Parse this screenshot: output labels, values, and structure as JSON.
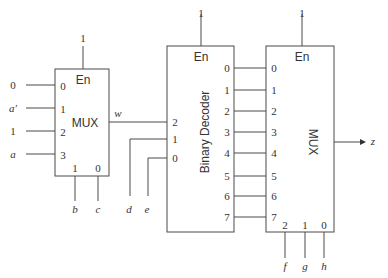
{
  "diagram": {
    "mux1": {
      "enable_value": "1",
      "enable_label": "En",
      "title": "MUX",
      "input_pins": [
        "0",
        "1",
        "2",
        "3"
      ],
      "input_signals": [
        "0",
        "a'",
        "1",
        "a"
      ],
      "select_pins": [
        "1",
        "0"
      ],
      "select_signals": [
        "b",
        "c"
      ],
      "output_signal": "w"
    },
    "decoder": {
      "enable_value": "1",
      "enable_label": "En",
      "title": "Binary Decoder",
      "input_pins": [
        "2",
        "1",
        "0"
      ],
      "input_signals": [
        "w",
        "d",
        "e"
      ],
      "output_pins": [
        "0",
        "1",
        "2",
        "3",
        "4",
        "5",
        "6",
        "7"
      ]
    },
    "mux2": {
      "enable_value": "1",
      "enable_label": "En",
      "title": "MUX",
      "input_pins": [
        "0",
        "1",
        "2",
        "3",
        "4",
        "5",
        "6",
        "7"
      ],
      "select_pins": [
        "2",
        "1",
        "0"
      ],
      "select_signals": [
        "f",
        "g",
        "h"
      ],
      "output_signal": "z"
    }
  }
}
